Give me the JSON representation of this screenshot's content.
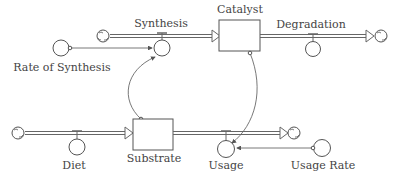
{
  "diagram": {
    "type": "stock-and-flow",
    "stocks": [
      {
        "id": "catalyst",
        "label": "Catalyst"
      },
      {
        "id": "substrate",
        "label": "Substrate"
      }
    ],
    "flows": [
      {
        "id": "synthesis",
        "label": "Synthesis",
        "from": "cloud",
        "to": "catalyst"
      },
      {
        "id": "degradation",
        "label": "Degradation",
        "from": "catalyst",
        "to": "cloud"
      },
      {
        "id": "diet",
        "label": "Diet",
        "from": "cloud",
        "to": "substrate"
      },
      {
        "id": "usage",
        "label": "Usage",
        "from": "substrate",
        "to": "cloud"
      }
    ],
    "converters": [
      {
        "id": "rate_of_synthesis",
        "label": "Rate of Synthesis"
      },
      {
        "id": "usage_rate",
        "label": "Usage Rate"
      }
    ],
    "connectors": [
      {
        "from": "rate_of_synthesis",
        "to": "synthesis"
      },
      {
        "from": "substrate",
        "to": "synthesis"
      },
      {
        "from": "catalyst",
        "to": "usage"
      },
      {
        "from": "usage_rate",
        "to": "usage"
      }
    ]
  },
  "labels": {
    "synthesis": "Synthesis",
    "catalyst": "Catalyst",
    "degradation": "Degradation",
    "rate_of_synthesis": "Rate of Synthesis",
    "diet": "Diet",
    "substrate": "Substrate",
    "usage": "Usage",
    "usage_rate": "Usage Rate"
  }
}
